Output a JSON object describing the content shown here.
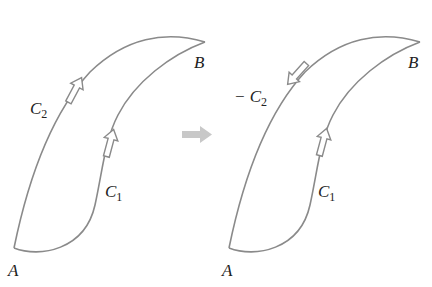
{
  "left_panel": {
    "point_a": "A",
    "point_b": "B",
    "curve_1": {
      "name": "C",
      "sub": "1"
    },
    "curve_2": {
      "name": "C",
      "sub": "2"
    }
  },
  "right_panel": {
    "point_a": "A",
    "point_b": "B",
    "curve_1": {
      "name": "C",
      "sub": "1"
    },
    "curve_2": {
      "name": "− C",
      "sub": "2"
    }
  },
  "transform_arrow": "right-arrow",
  "colors": {
    "curve": "#8a8a8a",
    "arrow_fill": "#ffffff",
    "transform_arrow": "#c8c8c8",
    "text": "#222222"
  }
}
